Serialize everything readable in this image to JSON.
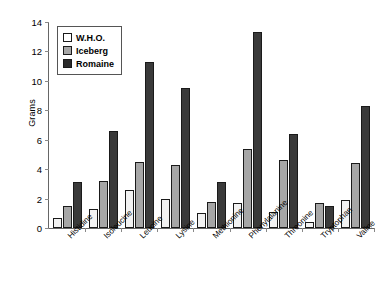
{
  "chart_data": {
    "type": "bar",
    "title": "",
    "xlabel": "",
    "ylabel": "Grams",
    "ylim": [
      0,
      14
    ],
    "ytick_step": 2,
    "yticks": [
      0,
      2,
      4,
      6,
      8,
      10,
      12,
      14
    ],
    "grid": false,
    "legend_position": "top-left-inside",
    "categories": [
      "Histidine",
      "Isoleucine",
      "Leucine",
      "Lysine",
      "Methionine",
      "Phenylalanine",
      "Threonine",
      "Tryptophan",
      "Valine"
    ],
    "series": [
      {
        "name": "W.H.O.",
        "color": "#f2f2f2",
        "values": [
          0.7,
          1.3,
          2.6,
          2.0,
          1.0,
          1.7,
          1.1,
          0.4,
          1.9
        ]
      },
      {
        "name": "Iceberg",
        "color": "#a6a6a6",
        "values": [
          1.5,
          3.2,
          4.5,
          4.3,
          1.8,
          5.4,
          4.6,
          1.7,
          4.4
        ]
      },
      {
        "name": "Romaine",
        "color": "#3a3a3a",
        "values": [
          3.1,
          6.6,
          11.3,
          9.5,
          3.1,
          13.3,
          6.4,
          1.5,
          8.3
        ]
      }
    ]
  }
}
